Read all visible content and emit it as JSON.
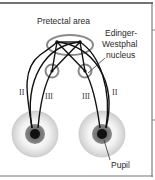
{
  "diagram": {
    "labels": {
      "pretectal_area": "Pretectal area",
      "edinger_westphal_line1": "Edinger-",
      "edinger_westphal_line2": "Westphal",
      "edinger_westphal_line3": "nucleus",
      "pupil": "Pupil"
    },
    "nerves": {
      "left_optic": "II",
      "left_oculomotor": "III",
      "right_oculomotor": "III",
      "right_optic": "II"
    },
    "colors": {
      "line": "#111111",
      "structure_outline": "#8a8a8a",
      "iris_outer": "#dcdcdc",
      "iris_inner": "#6a6a6a",
      "pupil": "#111111",
      "border": "#555555"
    }
  }
}
